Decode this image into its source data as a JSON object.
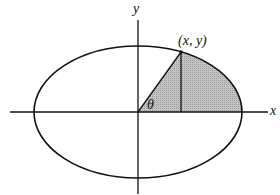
{
  "diagram": {
    "type": "ellipse-sector",
    "axes": {
      "x_label": "x",
      "y_label": "y"
    },
    "point_label": "(x, y)",
    "angle_label": "θ",
    "colors": {
      "stroke": "#111111",
      "shade": "#b8b8b8",
      "background": "#ffffff"
    },
    "geometry": {
      "origin": [
        138,
        112
      ],
      "rx": 104,
      "ry": 66,
      "point": [
        181,
        52
      ]
    }
  }
}
